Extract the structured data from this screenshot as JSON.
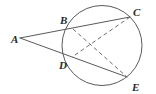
{
  "figure": {
    "type": "geometry-diagram",
    "canvas": {
      "width": 156,
      "height": 94
    },
    "background_color": "#ffffff",
    "stroke_color": "#5a5a5a",
    "label_color": "#2b2b2b",
    "circle": {
      "name": "circle",
      "cx": 102,
      "cy": 45.5,
      "r": 40,
      "stroke_width": 1
    },
    "points": [
      {
        "id": "A",
        "label": "A",
        "x": 20,
        "y": 38,
        "label_x": 11,
        "label_y": 43,
        "on_circle": false
      },
      {
        "id": "B",
        "label": "B",
        "x": 73,
        "y": 29,
        "label_x": 60,
        "label_y": 24,
        "on_circle": true
      },
      {
        "id": "C",
        "label": "C",
        "x": 130,
        "y": 17,
        "label_x": 133,
        "label_y": 16,
        "on_circle": true
      },
      {
        "id": "D",
        "label": "D",
        "x": 72,
        "y": 57,
        "label_x": 59,
        "label_y": 69,
        "on_circle": true
      },
      {
        "id": "E",
        "label": "E",
        "x": 127,
        "y": 77,
        "label_x": 132,
        "label_y": 91,
        "on_circle": true
      }
    ],
    "segments": [
      {
        "name": "secant-a-c",
        "from": "A",
        "to": "C",
        "style": "solid",
        "stroke_width": 1
      },
      {
        "name": "secant-a-e",
        "from": "A",
        "to": "E",
        "style": "solid",
        "stroke_width": 1
      },
      {
        "name": "chord-b-e",
        "from": "B",
        "to": "E",
        "style": "dashed",
        "stroke_width": 1,
        "dash": "4 3"
      },
      {
        "name": "chord-c-d",
        "from": "C",
        "to": "D",
        "style": "dashed",
        "stroke_width": 1,
        "dash": "4 3"
      }
    ],
    "labels": {
      "a": "A",
      "b": "B",
      "c": "C",
      "d": "D",
      "e": "E"
    }
  }
}
